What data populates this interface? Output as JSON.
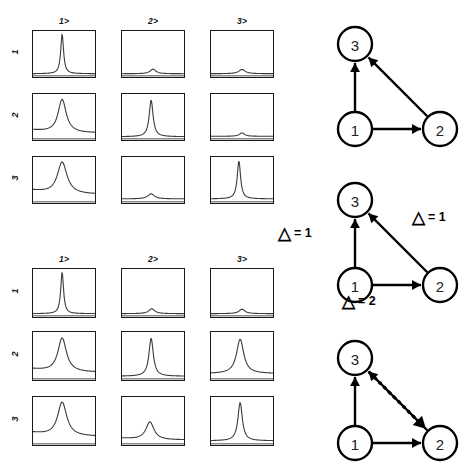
{
  "figure": {
    "title": "",
    "panels": [
      {
        "id": "spectra-grid-top",
        "col_headers": [
          "1>",
          "2>",
          "3>"
        ],
        "row_labels": [
          "1",
          "2",
          "3"
        ]
      },
      {
        "id": "spectra-grid-bottom",
        "col_headers": [
          "1>",
          "2>",
          "3>"
        ],
        "row_labels": [
          "1",
          "2",
          "3"
        ]
      }
    ]
  },
  "chart_data": {
    "type": "line",
    "title": "",
    "xlabel": "",
    "ylabel": "",
    "grid": false,
    "legend": "none",
    "grids": [
      {
        "name": "spectra-grid-top",
        "col_headers": [
          "1>",
          "2>",
          "3>"
        ],
        "row_labels": [
          "1",
          "2",
          "3"
        ],
        "cells": [
          {
            "row": "1",
            "col": "1>",
            "peak_center": 0.47,
            "peak_height": 0.97,
            "width": 0.055,
            "baseline": 0.03
          },
          {
            "row": "1",
            "col": "2>",
            "peak_center": 0.5,
            "peak_height": 0.14,
            "width": 0.11,
            "baseline": 0.03
          },
          {
            "row": "1",
            "col": "3>",
            "peak_center": 0.5,
            "peak_height": 0.13,
            "width": 0.13,
            "baseline": 0.03
          },
          {
            "row": "2",
            "col": "1>",
            "peak_center": 0.47,
            "peak_height": 0.92,
            "width": 0.16,
            "baseline": 0.12
          },
          {
            "row": "2",
            "col": "2>",
            "peak_center": 0.47,
            "peak_height": 0.9,
            "width": 0.075,
            "baseline": 0.03
          },
          {
            "row": "2",
            "col": "3>",
            "peak_center": 0.5,
            "peak_height": 0.12,
            "width": 0.1,
            "baseline": 0.04
          },
          {
            "row": "3",
            "col": "1>",
            "peak_center": 0.47,
            "peak_height": 0.93,
            "width": 0.19,
            "baseline": 0.16
          },
          {
            "row": "3",
            "col": "2>",
            "peak_center": 0.47,
            "peak_height": 0.17,
            "width": 0.13,
            "baseline": 0.05
          },
          {
            "row": "3",
            "col": "3>",
            "peak_center": 0.45,
            "peak_height": 0.95,
            "width": 0.065,
            "baseline": 0.05
          }
        ]
      },
      {
        "name": "spectra-grid-bottom",
        "col_headers": [
          "1>",
          "2>",
          "3>"
        ],
        "row_labels": [
          "1",
          "2",
          "3"
        ],
        "cells": [
          {
            "row": "1",
            "col": "1>",
            "peak_center": 0.47,
            "peak_height": 0.97,
            "width": 0.055,
            "baseline": 0.03
          },
          {
            "row": "1",
            "col": "2>",
            "peak_center": 0.48,
            "peak_height": 0.14,
            "width": 0.12,
            "baseline": 0.03
          },
          {
            "row": "1",
            "col": "3>",
            "peak_center": 0.5,
            "peak_height": 0.13,
            "width": 0.12,
            "baseline": 0.03
          },
          {
            "row": "2",
            "col": "1>",
            "peak_center": 0.47,
            "peak_height": 0.91,
            "width": 0.17,
            "baseline": 0.13
          },
          {
            "row": "2",
            "col": "2>",
            "peak_center": 0.47,
            "peak_height": 0.9,
            "width": 0.085,
            "baseline": 0.04
          },
          {
            "row": "2",
            "col": "3>",
            "peak_center": 0.47,
            "peak_height": 0.88,
            "width": 0.14,
            "baseline": 0.1
          },
          {
            "row": "3",
            "col": "1>",
            "peak_center": 0.47,
            "peak_height": 0.93,
            "width": 0.18,
            "baseline": 0.15
          },
          {
            "row": "3",
            "col": "2>",
            "peak_center": 0.45,
            "peak_height": 0.48,
            "width": 0.16,
            "baseline": 0.07
          },
          {
            "row": "3",
            "col": "3>",
            "peak_center": 0.47,
            "peak_height": 0.92,
            "width": 0.085,
            "baseline": 0.05
          }
        ]
      }
    ]
  },
  "graphs": [
    {
      "id": "graph-top",
      "nodes": [
        {
          "label": "3",
          "x": 55,
          "y": 32
        },
        {
          "label": "1",
          "x": 55,
          "y": 117
        },
        {
          "label": "2",
          "x": 140,
          "y": 117
        }
      ],
      "edges": [
        {
          "from": "1",
          "to": "3",
          "style": "solid",
          "label": ""
        },
        {
          "from": "1",
          "to": "2",
          "style": "solid",
          "label": ""
        },
        {
          "from": "2",
          "to": "3",
          "style": "solid",
          "label": ""
        }
      ]
    },
    {
      "id": "graph-middle",
      "nodes": [
        {
          "label": "3",
          "x": 55,
          "y": 32
        },
        {
          "label": "1",
          "x": 55,
          "y": 117
        },
        {
          "label": "2",
          "x": 140,
          "y": 117
        }
      ],
      "edges": [
        {
          "from": "1",
          "to": "3",
          "style": "solid",
          "label": "= 1"
        },
        {
          "from": "1",
          "to": "2",
          "style": "solid",
          "label": "= 2"
        },
        {
          "from": "2",
          "to": "3",
          "style": "solid",
          "label": "= 1"
        }
      ],
      "delta_labels": [
        "= 1",
        "= 1",
        "= 2"
      ]
    },
    {
      "id": "graph-bottom",
      "nodes": [
        {
          "label": "3",
          "x": 55,
          "y": 32
        },
        {
          "label": "1",
          "x": 55,
          "y": 117
        },
        {
          "label": "2",
          "x": 140,
          "y": 117
        }
      ],
      "edges": [
        {
          "from": "1",
          "to": "3",
          "style": "solid",
          "label": ""
        },
        {
          "from": "1",
          "to": "2",
          "style": "solid",
          "label": ""
        },
        {
          "from": "2",
          "to": "3",
          "style": "solid",
          "label": ""
        },
        {
          "from": "3",
          "to": "2",
          "style": "dotted",
          "label": ""
        }
      ]
    }
  ],
  "colors": {
    "ink": "#000000",
    "curve": "#3b3b3b",
    "frame": "#1a1a1a",
    "background": "#ffffff"
  }
}
